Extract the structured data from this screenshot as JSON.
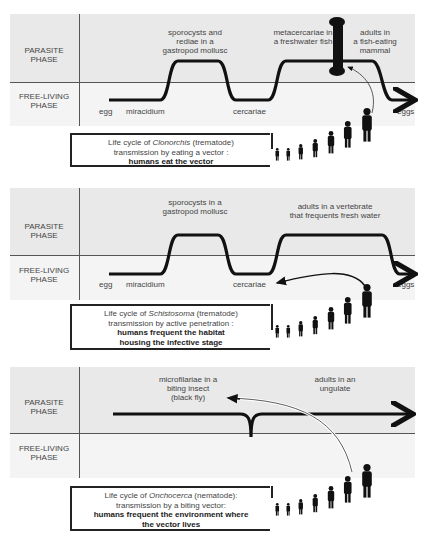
{
  "labels": {
    "parasite_line1": "PARASITE",
    "parasite_line2": "PHASE",
    "free_line1": "FREE-LIVING",
    "free_line2": "PHASE"
  },
  "panels": [
    {
      "stages": {
        "egg": "egg",
        "miracidium": "miracidium",
        "cercariae": "cercariae",
        "eggs": "eggs"
      },
      "hosts": {
        "first_l1": "sporocysts and",
        "first_l2": "rediae in a",
        "first_l3": "gastropod mollusc",
        "second_l1": "metacercariae in",
        "second_l2": "a freshwater fish",
        "third_l1": "adults in",
        "third_l2": "a fish-eating",
        "third_l3": "mammal"
      },
      "caption": {
        "prefix": "Life cycle of ",
        "genus": "Clonorchis",
        "suffix": " (trematode)",
        "line2": "transmission by eating a vector :",
        "bold1": "humans eat the vector"
      },
      "icon": "fish-bone-vector-icon"
    },
    {
      "stages": {
        "egg": "egg",
        "miracidium": "miracidium",
        "cercariae": "cercariae",
        "eggs": "eggs"
      },
      "hosts": {
        "first_l1": "sporocysts in a",
        "first_l2": "gastropod mollusc",
        "second_l1": "adults in a vertebrate",
        "second_l2": "that frequents fresh water"
      },
      "caption": {
        "prefix": "Life cycle of ",
        "genus": "Schistosoma",
        "suffix": " (trematode)",
        "line2": "transmission by active penetration :",
        "bold1": "humans frequent the habitat",
        "bold2": "housing the infective stage"
      }
    },
    {
      "hosts": {
        "first_l1": "microfilariae in a",
        "first_l2": "biting insect",
        "first_l3": "(black fly)",
        "second_l1": "adults in an",
        "second_l2": "ungulate"
      },
      "caption": {
        "prefix": "Life cycle of ",
        "genus": "Onchocerca",
        "suffix": " (nematode):",
        "line2": "transmission by a biting vector:",
        "bold1": "humans frequent the environment where",
        "bold2": "the vector lives"
      }
    }
  ],
  "human_figure_count_per_panel": 7
}
